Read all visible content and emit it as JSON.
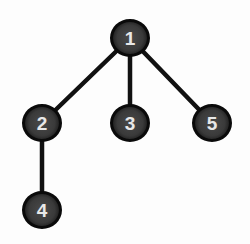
{
  "diagram": {
    "type": "tree",
    "colors": {
      "background": "#fdfdfd",
      "node_fill": "#3a3a3a",
      "node_outline": "#0a0a0a",
      "label": "#e8e8e8",
      "edge": "#111111"
    },
    "nodes": [
      {
        "id": "1",
        "label": "1",
        "x": 130,
        "y": 38
      },
      {
        "id": "2",
        "label": "2",
        "x": 42,
        "y": 123
      },
      {
        "id": "3",
        "label": "3",
        "x": 130,
        "y": 123
      },
      {
        "id": "5",
        "label": "5",
        "x": 212,
        "y": 123
      },
      {
        "id": "4",
        "label": "4",
        "x": 42,
        "y": 210
      }
    ],
    "edges": [
      {
        "from": "1",
        "to": "2"
      },
      {
        "from": "1",
        "to": "3"
      },
      {
        "from": "1",
        "to": "5"
      },
      {
        "from": "2",
        "to": "4"
      }
    ]
  }
}
